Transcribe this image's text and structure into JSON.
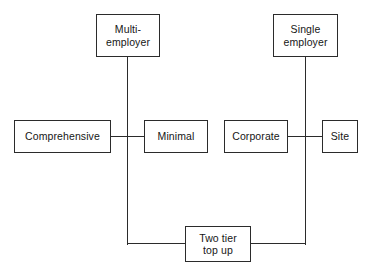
{
  "diagram": {
    "type": "flow-diagram",
    "title": "",
    "nodes": [
      {
        "id": "multi-employer",
        "label": "Multi-\nemployer",
        "x": 96,
        "y": 14,
        "w": 64,
        "h": 43
      },
      {
        "id": "single-employer",
        "label": "Single\nemployer",
        "x": 273,
        "y": 14,
        "w": 65,
        "h": 43
      },
      {
        "id": "comprehensive",
        "label": "Comprehensive",
        "x": 14,
        "y": 120,
        "w": 97,
        "h": 33
      },
      {
        "id": "minimal",
        "label": "Minimal",
        "x": 144,
        "y": 120,
        "w": 64,
        "h": 33
      },
      {
        "id": "corporate",
        "label": "Corporate",
        "x": 224,
        "y": 120,
        "w": 64,
        "h": 33
      },
      {
        "id": "site",
        "label": "Site",
        "x": 322,
        "y": 120,
        "w": 36,
        "h": 33
      },
      {
        "id": "two-tier-top-up",
        "label": "Two tier\ntop up",
        "x": 185,
        "y": 226,
        "w": 66,
        "h": 36
      }
    ],
    "edges": [
      {
        "id": "multi-employer-stem",
        "orient": "v",
        "x": 127,
        "y": 57,
        "len": 188
      },
      {
        "id": "single-employer-stem",
        "orient": "v",
        "x": 305,
        "y": 57,
        "len": 188
      },
      {
        "id": "comprehensive-to-minimal",
        "orient": "h",
        "x": 111,
        "y": 136,
        "len": 33
      },
      {
        "id": "corporate-to-site",
        "orient": "h",
        "x": 288,
        "y": 136,
        "len": 34
      },
      {
        "id": "left-leg-to-two-tier",
        "orient": "h",
        "x": 127,
        "y": 243,
        "len": 58
      },
      {
        "id": "right-leg-to-two-tier",
        "orient": "h",
        "x": 251,
        "y": 243,
        "len": 55
      }
    ]
  }
}
